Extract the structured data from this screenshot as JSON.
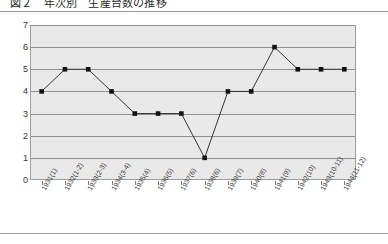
{
  "header": {
    "title_clipped": "図２　年次別　生産台数の推移"
  },
  "chart_data": {
    "type": "line",
    "title": "",
    "xlabel": "",
    "ylabel": "",
    "ylim": [
      0,
      7
    ],
    "yticks": [
      0,
      1,
      2,
      3,
      4,
      5,
      6,
      7
    ],
    "grid": true,
    "legend": "none",
    "marker": "square",
    "line_color": "#333333",
    "marker_color": "#111111",
    "plot_bg": "#e9e9e9",
    "categories": [
      "1931(1)",
      "1932(1-2)",
      "1933(2-3)",
      "1934(3-4)",
      "1935(4)",
      "1936(5)",
      "1937(6)",
      "1938(6)",
      "1939(7)",
      "1940(8)",
      "1941(9)",
      "1942(10)",
      "1943(10-11)",
      "1944(11-12)"
    ],
    "values": [
      4,
      5,
      5,
      4,
      3,
      3,
      3,
      1,
      4,
      4,
      6,
      5,
      5,
      5
    ]
  }
}
